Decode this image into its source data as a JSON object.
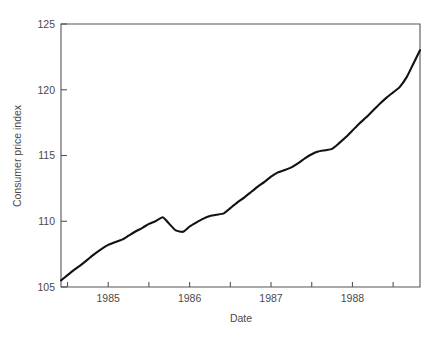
{
  "chart_data": {
    "type": "line",
    "title": "",
    "xlabel": "Date",
    "ylabel": "Consumer price index",
    "xlim": [
      1984.42,
      1988.83
    ],
    "ylim": [
      105,
      125
    ],
    "grid": false,
    "legend": null,
    "x_tick_labels": [
      "1985",
      "1986",
      "1987",
      "1988"
    ],
    "x_tick_values": [
      1985,
      1986,
      1987,
      1988
    ],
    "x_minor_tick_values": [
      1984.5,
      1985.5,
      1986.5,
      1987.5,
      1988.5
    ],
    "y_tick_labels": [
      "105",
      "110",
      "115",
      "120",
      "125"
    ],
    "y_tick_values": [
      105,
      110,
      115,
      120,
      125
    ],
    "series": [
      {
        "name": "Consumer price index",
        "x": [
          1984.42,
          1984.5,
          1984.58,
          1984.67,
          1984.75,
          1984.83,
          1984.92,
          1985.0,
          1985.08,
          1985.17,
          1985.25,
          1985.33,
          1985.42,
          1985.5,
          1985.58,
          1985.67,
          1985.75,
          1985.83,
          1985.92,
          1986.0,
          1986.08,
          1986.17,
          1986.25,
          1986.33,
          1986.42,
          1986.5,
          1986.58,
          1986.67,
          1986.75,
          1986.83,
          1986.92,
          1987.0,
          1987.08,
          1987.17,
          1987.25,
          1987.33,
          1987.42,
          1987.5,
          1987.58,
          1987.67,
          1987.75,
          1987.83,
          1987.92,
          1988.0,
          1988.08,
          1988.17,
          1988.25,
          1988.33,
          1988.42,
          1988.5,
          1988.58,
          1988.67,
          1988.75,
          1988.83
        ],
        "y": [
          105.5,
          105.9,
          106.3,
          106.7,
          107.1,
          107.5,
          107.9,
          108.2,
          108.4,
          108.6,
          108.9,
          109.2,
          109.5,
          109.8,
          110.0,
          110.3,
          109.8,
          109.3,
          109.2,
          109.6,
          109.9,
          110.2,
          110.4,
          110.5,
          110.6,
          111.0,
          111.4,
          111.8,
          112.2,
          112.6,
          113.0,
          113.4,
          113.7,
          113.9,
          114.1,
          114.4,
          114.8,
          115.1,
          115.3,
          115.4,
          115.5,
          115.9,
          116.4,
          116.9,
          117.4,
          117.9,
          118.4,
          118.9,
          119.4,
          119.8,
          120.2,
          121.0,
          122.0,
          123.0
        ]
      }
    ]
  },
  "plot_geometry": {
    "left": 61,
    "right": 420,
    "top": 24,
    "bottom": 287
  },
  "colors": {
    "line": "#121212",
    "frame": "#555555",
    "text": "#4a4a4a",
    "background": "#ffffff"
  }
}
